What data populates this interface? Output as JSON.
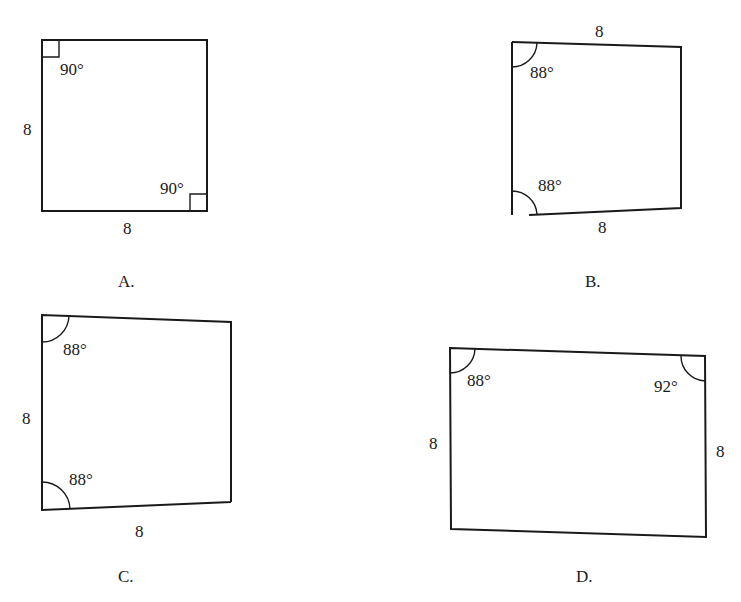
{
  "figures": [
    {
      "option": "A.",
      "shape": "square",
      "side_labels": [
        "8",
        "8"
      ],
      "angle_labels": [
        "90°",
        "90°"
      ]
    },
    {
      "option": "B.",
      "shape": "quadrilateral",
      "side_labels": [
        "8",
        "8"
      ],
      "angle_labels": [
        "88°",
        "88°"
      ]
    },
    {
      "option": "C.",
      "shape": "quadrilateral",
      "side_labels": [
        "8",
        "8"
      ],
      "angle_labels": [
        "88°",
        "88°"
      ]
    },
    {
      "option": "D.",
      "shape": "quadrilateral",
      "side_labels": [
        "8",
        "8"
      ],
      "angle_labels": [
        "88°",
        "92°"
      ]
    }
  ]
}
